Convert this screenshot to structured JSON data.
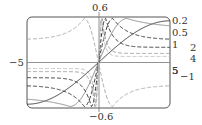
{
  "chart_data": {
    "type": "line",
    "title": "",
    "xlabel": "",
    "ylabel": "",
    "xlim": [
      -5,
      5
    ],
    "ylim": [
      -0.6,
      0.6
    ],
    "tick_labels": {
      "x_left": "−5",
      "x_right": "5",
      "y_top": "0.6",
      "y_bottom": "−0.6"
    },
    "grid": false,
    "legend_position": "right, inline curve labels",
    "series": [
      {
        "name": "0.2",
        "label": "0.2",
        "style": "solid",
        "color": "#333333",
        "peak_x": 5.0,
        "peak_y": 0.55,
        "tail_y": 0.55
      },
      {
        "name": "0.5",
        "label": "0.5",
        "style": "solid",
        "color": "#8a8a8a",
        "peak_x": 2.0,
        "peak_y": 0.58,
        "tail_y": 0.45
      },
      {
        "name": "1",
        "label": "1",
        "style": "dashed",
        "color": "#333333",
        "peak_x": 1.0,
        "peak_y": 0.58,
        "tail_y": 0.3
      },
      {
        "name": "2",
        "label": "2",
        "style": "dashed",
        "color": "#333333",
        "peak_x": 0.5,
        "peak_y": 0.58,
        "tail_y": 0.2
      },
      {
        "name": "4",
        "label": "4",
        "style": "dashed",
        "color": "#9a9a9a",
        "peak_x": 0.25,
        "peak_y": 0.58,
        "tail_y": 0.12
      },
      {
        "name": "5",
        "label": "5",
        "style": "dashed",
        "color": "#bbbbbb",
        "peak_x": 0.2,
        "peak_y": 0.58,
        "tail_y": 0.08
      },
      {
        "name": "-1",
        "label": "−1",
        "style": "dashed",
        "color": "#aaaaaa",
        "peak_x": -1.0,
        "peak_y": 0.58,
        "tail_y": 0.3,
        "reversed": true
      }
    ]
  }
}
